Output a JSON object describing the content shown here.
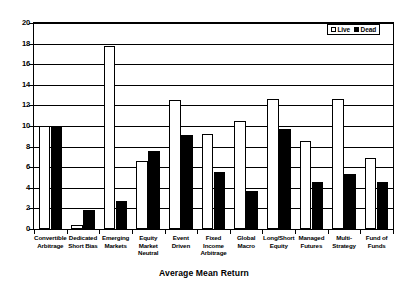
{
  "chart_data": {
    "type": "bar",
    "title": "",
    "xlabel": "Average Mean Return",
    "ylabel": "",
    "ylim": [
      0,
      20
    ],
    "yticks": [
      0,
      2,
      4,
      6,
      8,
      10,
      12,
      14,
      16,
      18,
      20
    ],
    "grid": true,
    "legend_position": "top-right",
    "categories": [
      "Convertible Arbitrage",
      "Dedicated Short Bias",
      "Emerging Markets",
      "Equity Market Neutral",
      "Event Driven",
      "Fixed Income Arbitrage",
      "Global Macro",
      "Long/Short Equity",
      "Managed Futures",
      "Multi-Strategy",
      "Fund of Funds"
    ],
    "category_lines": [
      [
        "Convertible",
        "Arbitrage"
      ],
      [
        "Dedicated",
        "Short Bias"
      ],
      [
        "Emerging",
        "Markets"
      ],
      [
        "Equity",
        "Market",
        "Neutral"
      ],
      [
        "Event",
        "Driven"
      ],
      [
        "Fixed",
        "Income",
        "Arbitrage"
      ],
      [
        "Global",
        "Macro"
      ],
      [
        "Long/Short",
        "Equity"
      ],
      [
        "Managed",
        "Futures"
      ],
      [
        "Multi-",
        "Strategy"
      ],
      [
        "Fund of",
        "Funds"
      ]
    ],
    "series": [
      {
        "name": "Live",
        "color": "#ffffff",
        "values": [
          10.0,
          0.4,
          17.8,
          6.6,
          12.5,
          9.2,
          10.5,
          12.6,
          8.5,
          12.6,
          6.9
        ]
      },
      {
        "name": "Dead",
        "color": "#000000",
        "values": [
          10.0,
          1.8,
          2.7,
          7.6,
          9.1,
          5.5,
          3.7,
          9.7,
          4.6,
          5.3,
          4.6
        ]
      }
    ]
  },
  "legend": {
    "entries": [
      {
        "label": "Live",
        "swatch": "live"
      },
      {
        "label": "Dead",
        "swatch": "dead"
      }
    ]
  },
  "axis": {
    "x_title": "Average Mean Return"
  }
}
